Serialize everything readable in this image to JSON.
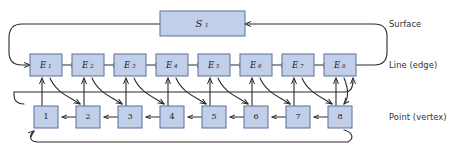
{
  "diagram": {
    "colors": {
      "node_fill": "#c2cfe8",
      "node_stroke": "#5b6e9c",
      "connector": "#2b2b2b",
      "background": "#ffffff",
      "text": "#1a1a2e"
    },
    "tier_labels": [
      {
        "id": "surface",
        "text": "Surface"
      },
      {
        "id": "line-edge",
        "text": "Line (edge)"
      },
      {
        "id": "point-vertex",
        "text": "Point (vertex)"
      }
    ],
    "surface": {
      "label_base": "S",
      "label_sub": "1",
      "label_full": "S1"
    },
    "edges": [
      {
        "base": "E",
        "sub": "1"
      },
      {
        "base": "E",
        "sub": "2"
      },
      {
        "base": "E",
        "sub": "3"
      },
      {
        "base": "E",
        "sub": "4"
      },
      {
        "base": "E",
        "sub": "5"
      },
      {
        "base": "E",
        "sub": "6"
      },
      {
        "base": "E",
        "sub": "7"
      },
      {
        "base": "E",
        "sub": "8"
      }
    ],
    "vertices": [
      {
        "label": "1"
      },
      {
        "label": "2"
      },
      {
        "label": "3"
      },
      {
        "label": "4"
      },
      {
        "label": "5"
      },
      {
        "label": "6"
      },
      {
        "label": "7"
      },
      {
        "label": "8"
      }
    ]
  }
}
